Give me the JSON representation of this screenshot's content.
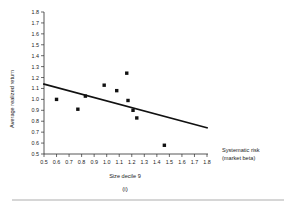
{
  "figure": {
    "panel_label": "(i)",
    "background": "#ffffff",
    "marker_color": "#111111",
    "line_color": "#111111",
    "axis_color": "#2b2b2b",
    "rule_color": "#c9c9c9"
  },
  "chart_data": {
    "type": "scatter",
    "title": "",
    "subtitle": "",
    "xlabel": "Size decile 9",
    "xlabel_right": "Systematic risk",
    "xlabel_right_line2": "(market beta)",
    "ylabel": "Average realized return",
    "panel": "(i)",
    "xlim": [
      0.5,
      1.8
    ],
    "ylim": [
      0.5,
      1.8
    ],
    "xticks": [
      0.5,
      0.6,
      0.7,
      0.8,
      0.9,
      1.0,
      1.1,
      1.2,
      1.3,
      1.4,
      1.5,
      1.6,
      1.7,
      1.8
    ],
    "yticks": [
      0.5,
      0.6,
      0.7,
      0.8,
      0.9,
      1.0,
      1.1,
      1.2,
      1.3,
      1.4,
      1.5,
      1.6,
      1.7,
      1.8
    ],
    "xticklabels": [
      "0.5",
      "0.6",
      "0.7",
      "0.8",
      "0.9",
      "1.0",
      "1.1",
      "1.2",
      "1.3",
      "1.4",
      "1.5",
      "1.6",
      "1.7",
      "1.8"
    ],
    "yticklabels": [
      "0.5",
      "0.6",
      "0.7",
      "0.8",
      "0.9",
      "1.0",
      "1.1",
      "1.2",
      "1.3",
      "1.4",
      "1.5",
      "1.6",
      "1.7",
      "1.8"
    ],
    "grid": false,
    "legend": false,
    "points": [
      {
        "x": 0.6,
        "y": 1.0
      },
      {
        "x": 0.77,
        "y": 0.91
      },
      {
        "x": 0.83,
        "y": 1.03
      },
      {
        "x": 0.98,
        "y": 1.13
      },
      {
        "x": 1.08,
        "y": 1.08
      },
      {
        "x": 1.16,
        "y": 1.24
      },
      {
        "x": 1.17,
        "y": 0.99
      },
      {
        "x": 1.21,
        "y": 0.9
      },
      {
        "x": 1.24,
        "y": 0.83
      },
      {
        "x": 1.46,
        "y": 0.58
      }
    ],
    "trend_line": {
      "x0": 0.5,
      "y0": 1.14,
      "x1": 1.8,
      "y1": 0.74
    }
  }
}
